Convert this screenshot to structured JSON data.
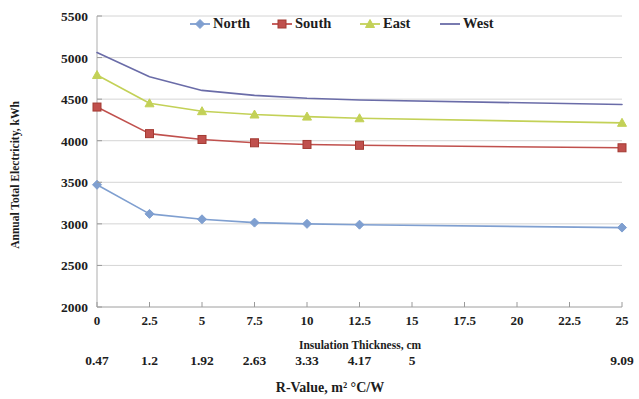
{
  "chart_data": {
    "type": "line",
    "title": "",
    "xlabel": "Insulation Thickness, cm",
    "ylabel": "Annual Total Electricity, kWh",
    "secondary_xlabel": "R-Value,  m² °C/W",
    "xlim": [
      0,
      25
    ],
    "ylim": [
      2000,
      5500
    ],
    "ytick_step": 500,
    "xtick_step": 2.5,
    "grid": true,
    "legend_position": "top-center",
    "yticks": [
      "5500",
      "5000",
      "4500",
      "4000",
      "3500",
      "3000",
      "2500",
      "2000"
    ],
    "xticks": [
      "0",
      "2.5",
      "5",
      "7.5",
      "10",
      "12.5",
      "15",
      "17.5",
      "20",
      "22.5",
      "25"
    ],
    "secondary_xticks": [
      {
        "x": 0,
        "label": "0.47"
      },
      {
        "x": 2.5,
        "label": "1.2"
      },
      {
        "x": 5,
        "label": "1.92"
      },
      {
        "x": 7.5,
        "label": "2.63"
      },
      {
        "x": 10,
        "label": "3.33"
      },
      {
        "x": 12.5,
        "label": "4.17"
      },
      {
        "x": 15,
        "label": "5"
      },
      {
        "x": 25,
        "label": "9.09"
      }
    ],
    "x": [
      0,
      2.5,
      5,
      7.5,
      10,
      12.5,
      25
    ],
    "series": [
      {
        "name": "North",
        "color": "#7f9fd0",
        "marker": "diamond",
        "values": [
          3470,
          3120,
          3055,
          3015,
          3000,
          2990,
          2955
        ]
      },
      {
        "name": "South",
        "color": "#c0504d",
        "marker": "square",
        "values": [
          4405,
          4085,
          4015,
          3975,
          3955,
          3945,
          3915
        ]
      },
      {
        "name": "East",
        "color": "#c3d157",
        "marker": "triangle",
        "values": [
          4790,
          4450,
          4355,
          4315,
          4290,
          4270,
          4215
        ]
      },
      {
        "name": "West",
        "color": "#6a6ca8",
        "marker": "none",
        "values": [
          5060,
          4770,
          4605,
          4545,
          4510,
          4490,
          4435
        ]
      }
    ]
  },
  "legend": {
    "items": [
      {
        "label": "North"
      },
      {
        "label": "South"
      },
      {
        "label": "East"
      },
      {
        "label": "West"
      }
    ]
  }
}
